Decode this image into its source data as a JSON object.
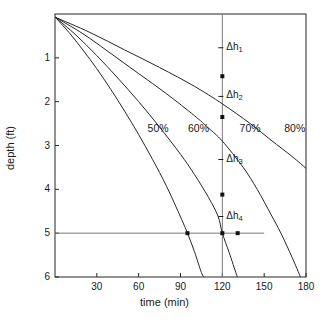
{
  "chart_data": {
    "type": "line",
    "title": "",
    "xlabel": "time (min)",
    "ylabel": "depth (ft)",
    "xlim": [
      0,
      180
    ],
    "ylim": [
      0,
      6
    ],
    "y_inverted": true,
    "grid": false,
    "legend": "inline-curve-labels",
    "xticks": [
      30,
      60,
      90,
      120,
      150,
      180
    ],
    "xtick_labels": [
      "30",
      "60",
      "90",
      "120",
      "150",
      "180"
    ],
    "yticks": [
      1,
      2,
      3,
      4,
      5,
      6
    ],
    "ytick_labels": [
      "1",
      "2",
      "3",
      "4",
      "5",
      "6"
    ],
    "series": [
      {
        "name": "50%",
        "label": "50%",
        "label_x": 75,
        "label_y": 2.62,
        "points": [
          {
            "t": 0,
            "d": 0.07
          },
          {
            "t": 10,
            "d": 0.42
          },
          {
            "t": 20,
            "d": 0.82
          },
          {
            "t": 30,
            "d": 1.25
          },
          {
            "t": 40,
            "d": 1.72
          },
          {
            "t": 50,
            "d": 2.22
          },
          {
            "t": 60,
            "d": 2.75
          },
          {
            "t": 70,
            "d": 3.32
          },
          {
            "t": 80,
            "d": 3.93
          },
          {
            "t": 90,
            "d": 4.63
          },
          {
            "t": 95,
            "d": 5.0
          },
          {
            "t": 100,
            "d": 5.42
          },
          {
            "t": 105,
            "d": 5.9
          },
          {
            "t": 107,
            "d": 6.0
          }
        ]
      },
      {
        "name": "60%",
        "label": "60%",
        "label_x": 104,
        "label_y": 2.62,
        "points": [
          {
            "t": 0,
            "d": 0.07
          },
          {
            "t": 15,
            "d": 0.48
          },
          {
            "t": 30,
            "d": 0.95
          },
          {
            "t": 45,
            "d": 1.46
          },
          {
            "t": 60,
            "d": 2.0
          },
          {
            "t": 75,
            "d": 2.58
          },
          {
            "t": 90,
            "d": 3.2
          },
          {
            "t": 100,
            "d": 3.66
          },
          {
            "t": 110,
            "d": 4.18
          },
          {
            "t": 117,
            "d": 4.62
          },
          {
            "t": 120,
            "d": 5.0
          },
          {
            "t": 125,
            "d": 5.45
          },
          {
            "t": 130,
            "d": 5.93
          },
          {
            "t": 131,
            "d": 6.0
          }
        ]
      },
      {
        "name": "70%",
        "label": "70%",
        "label_x": 141,
        "label_y": 2.62,
        "points": [
          {
            "t": 0,
            "d": 0.07
          },
          {
            "t": 20,
            "d": 0.45
          },
          {
            "t": 40,
            "d": 0.9
          },
          {
            "t": 60,
            "d": 1.36
          },
          {
            "t": 80,
            "d": 1.82
          },
          {
            "t": 100,
            "d": 2.32
          },
          {
            "t": 110,
            "d": 2.6
          },
          {
            "t": 120,
            "d": 2.9
          },
          {
            "t": 135,
            "d": 3.5
          },
          {
            "t": 145,
            "d": 4.0
          },
          {
            "t": 155,
            "d": 4.58
          },
          {
            "t": 162,
            "d": 5.0
          },
          {
            "t": 170,
            "d": 5.55
          },
          {
            "t": 176,
            "d": 6.0
          }
        ]
      },
      {
        "name": "80%",
        "label": "80%",
        "label_x": 173,
        "label_y": 2.62,
        "points": [
          {
            "t": 0,
            "d": 0.07
          },
          {
            "t": 25,
            "d": 0.42
          },
          {
            "t": 50,
            "d": 0.82
          },
          {
            "t": 75,
            "d": 1.22
          },
          {
            "t": 100,
            "d": 1.65
          },
          {
            "t": 120,
            "d": 2.05
          },
          {
            "t": 140,
            "d": 2.5
          },
          {
            "t": 155,
            "d": 2.88
          },
          {
            "t": 170,
            "d": 3.25
          },
          {
            "t": 180,
            "d": 3.52
          }
        ]
      }
    ],
    "reference_lines": [
      {
        "name": "vertical-120-min",
        "orientation": "vertical",
        "value": 120,
        "from": 0,
        "to": 6
      },
      {
        "name": "horizontal-depth-5ft",
        "orientation": "horizontal",
        "value": 5,
        "from": 0,
        "to": 150
      }
    ],
    "markers": [
      {
        "name": "marker-70pct-at-120",
        "t": 120,
        "d": 1.42,
        "on": "80%"
      },
      {
        "name": "marker-60pct-at-120",
        "t": 120,
        "d": 2.35,
        "on": "70%"
      },
      {
        "name": "marker-50pct-at-120",
        "t": 120,
        "d": 4.12,
        "on": "60%"
      },
      {
        "name": "marker-50pct-at-5ft",
        "t": 95,
        "d": 5.0,
        "on": "50%"
      },
      {
        "name": "marker-60pct-at-5ft",
        "t": 120,
        "d": 5.0,
        "on": "60%"
      },
      {
        "name": "marker-70pct-at-5ft",
        "t": 131,
        "d": 5.0,
        "on": "70%"
      }
    ],
    "annotations": [
      {
        "name": "delta-h-1",
        "text": "Δh",
        "sub": "1",
        "t": 120,
        "d": 0.77
      },
      {
        "name": "delta-h-2",
        "text": "Δh",
        "sub": "2",
        "t": 120,
        "d": 1.88
      },
      {
        "name": "delta-h-3",
        "text": "Δh",
        "sub": "3",
        "t": 120,
        "d": 3.32
      },
      {
        "name": "delta-h-4",
        "text": "Δh",
        "sub": "4",
        "t": 120,
        "d": 4.62
      }
    ],
    "colors": {
      "curve": "#262626",
      "axis": "#262626",
      "reference_line": "#7a7a7a",
      "marker": "#111111",
      "text": "#1a1a1a",
      "background": "#ffffff"
    }
  }
}
